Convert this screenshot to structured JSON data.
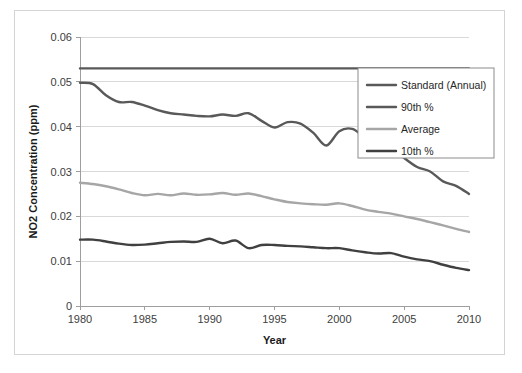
{
  "chart_data": {
    "type": "line",
    "title": "",
    "xlabel": "Year",
    "ylabel": "NO2 Concentration (ppm)",
    "xlim": [
      1980,
      2010
    ],
    "ylim": [
      0,
      0.06
    ],
    "xticks": [
      "1980",
      "1985",
      "1990",
      "1995",
      "2000",
      "2005",
      "2010"
    ],
    "xtick_values": [
      1980,
      1985,
      1990,
      1995,
      2000,
      2005,
      2010
    ],
    "yticks": [
      "0",
      "0.01",
      "0.02",
      "0.03",
      "0.04",
      "0.05",
      "0.06"
    ],
    "ytick_values": [
      0,
      0.01,
      0.02,
      0.03,
      0.04,
      0.05,
      0.06
    ],
    "grid": true,
    "legend_position": "right-upper",
    "x": [
      1980,
      1981,
      1982,
      1983,
      1984,
      1985,
      1986,
      1987,
      1988,
      1989,
      1990,
      1991,
      1992,
      1993,
      1994,
      1995,
      1996,
      1997,
      1998,
      1999,
      2000,
      2001,
      2002,
      2003,
      2004,
      2005,
      2006,
      2007,
      2008,
      2009,
      2010
    ],
    "series": [
      {
        "name": "Standard (Annual)",
        "color": "#595959",
        "width": 2.4,
        "values": [
          0.053,
          0.053,
          0.053,
          0.053,
          0.053,
          0.053,
          0.053,
          0.053,
          0.053,
          0.053,
          0.053,
          0.053,
          0.053,
          0.053,
          0.053,
          0.053,
          0.053,
          0.053,
          0.053,
          0.053,
          0.053,
          0.053,
          0.053,
          0.053,
          0.053,
          0.053,
          0.053,
          0.053,
          0.053,
          0.053,
          0.053
        ]
      },
      {
        "name": "90th %",
        "color": "#595959",
        "width": 2.4,
        "values": [
          0.0498,
          0.0495,
          0.047,
          0.0455,
          0.0455,
          0.0447,
          0.0437,
          0.043,
          0.0427,
          0.0424,
          0.0423,
          0.0427,
          0.0424,
          0.043,
          0.0413,
          0.0398,
          0.041,
          0.0407,
          0.0386,
          0.0358,
          0.039,
          0.0395,
          0.0375,
          0.036,
          0.0355,
          0.033,
          0.031,
          0.03,
          0.0278,
          0.0268,
          0.025
        ]
      },
      {
        "name": "Average",
        "color": "#a6a6a6",
        "width": 2.4,
        "values": [
          0.0275,
          0.0272,
          0.0267,
          0.026,
          0.0252,
          0.0247,
          0.025,
          0.0247,
          0.0251,
          0.0248,
          0.0249,
          0.0252,
          0.0248,
          0.0251,
          0.0245,
          0.0238,
          0.0232,
          0.0229,
          0.0227,
          0.0226,
          0.0229,
          0.0223,
          0.0215,
          0.021,
          0.0206,
          0.02,
          0.0194,
          0.0187,
          0.018,
          0.0172,
          0.0165
        ]
      },
      {
        "name": "10th %",
        "color": "#404040",
        "width": 2.4,
        "values": [
          0.0148,
          0.0148,
          0.0144,
          0.0139,
          0.0136,
          0.0137,
          0.014,
          0.0143,
          0.0144,
          0.0143,
          0.015,
          0.014,
          0.0146,
          0.0129,
          0.0136,
          0.0136,
          0.0134,
          0.0133,
          0.0131,
          0.0129,
          0.0129,
          0.0124,
          0.012,
          0.0117,
          0.0118,
          0.011,
          0.0104,
          0.01,
          0.0092,
          0.0085,
          0.008
        ]
      }
    ],
    "colors": {
      "standard": "#595959",
      "p90": "#595959",
      "average": "#a6a6a6",
      "p10": "#404040",
      "grid": "#d9d9d9",
      "axis": "#9e9e9e",
      "text": "#404040",
      "frame": "#d4d4d4"
    }
  }
}
